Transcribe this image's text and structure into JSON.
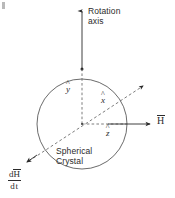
{
  "figure": {
    "type": "physics-vector-diagram",
    "background_color": "#ffffff",
    "ink_color": "#2b2b2b",
    "width": 175,
    "height": 198,
    "labels": {
      "rotation_axis_line1": "Rotation",
      "rotation_axis_line2": "axis",
      "spherical_crystal_line1": "Spherical",
      "spherical_crystal_line2": "Crystal",
      "y_hat_symbol": "y",
      "y_hat_accent": "^",
      "x_hat_symbol": "x",
      "x_hat_accent": "^",
      "z_hat_symbol": "z",
      "z_hat_accent": "^",
      "magnetic_field_symbol": "H",
      "derivative_numerator_d": "d",
      "derivative_numerator_H": "H",
      "derivative_denominator": "dt"
    },
    "geometry": {
      "circle_center_x": 82,
      "circle_center_y": 124,
      "circle_radius": 45,
      "rotation_axis_top_y": 8,
      "rotation_axis_bottom_y": 69,
      "x_axis_arrow_end_x": 146,
      "x_axis_arrow_end_y": 84,
      "x_axis_arrow_start_x": 27,
      "x_axis_arrow_start_y": 163,
      "h_arrow_end_x": 152,
      "h_arrow_y": 124
    }
  }
}
